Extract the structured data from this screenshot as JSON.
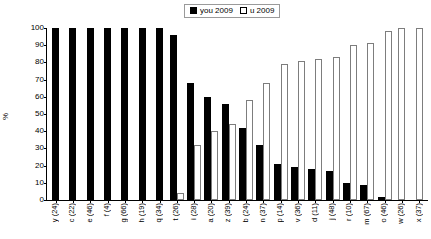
{
  "legend": {
    "entries": [
      {
        "label": "you 2009",
        "marker": "filled-square",
        "color": "#000000"
      },
      {
        "label": "u 2009",
        "marker": "open-square",
        "color": "#ffffff"
      }
    ]
  },
  "axes": {
    "ylabel": "%",
    "xlabel": "",
    "yticks": [
      "100",
      "90",
      "80",
      "70",
      "60",
      "50",
      "40",
      "30",
      "20",
      "10",
      "0"
    ]
  },
  "chart_data": {
    "type": "bar",
    "title": "",
    "xlabel": "",
    "ylabel": "%",
    "ylim": [
      0,
      100
    ],
    "grid": false,
    "legend_position": "top-center",
    "categories": [
      "y (24)",
      "c (22)",
      "e (46)",
      "f (4)",
      "g (66)",
      "h (19)",
      "q (34)",
      "t (26)",
      "i (28)",
      "a (20)",
      "z (39)",
      "b (24)",
      "n (37)",
      "p (14)",
      "v (36)",
      "d (11)",
      "j (48)",
      "r (10)",
      "m (67)",
      "o (46)",
      "w (26)",
      "x (37)"
    ],
    "series": [
      {
        "name": "you 2009",
        "color": "#000000",
        "values": [
          100,
          100,
          100,
          100,
          100,
          100,
          100,
          96,
          68,
          60,
          56,
          42,
          32,
          21,
          19,
          18,
          17,
          10,
          9,
          2,
          0,
          0
        ]
      },
      {
        "name": "u 2009",
        "color": "#ffffff",
        "values": [
          0,
          0,
          0,
          0,
          0,
          0,
          0,
          4,
          32,
          40,
          44,
          58,
          68,
          79,
          81,
          82,
          83,
          90,
          91,
          98,
          100,
          100
        ]
      }
    ]
  }
}
